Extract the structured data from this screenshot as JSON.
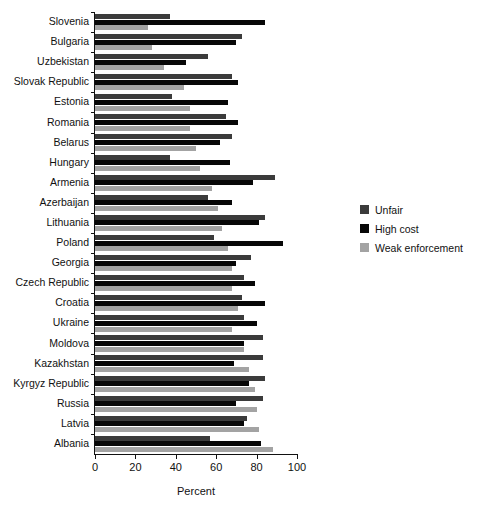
{
  "chart_data": {
    "type": "bar",
    "orientation": "horizontal",
    "title": "",
    "xlabel": "Percent",
    "ylabel": "",
    "xlim": [
      0,
      100
    ],
    "xticks": [
      0,
      20,
      40,
      60,
      80,
      100
    ],
    "xtick_labels": [
      "0",
      "20",
      "40",
      "60",
      "80",
      "100"
    ],
    "grid": false,
    "legend_position": "right",
    "categories": [
      "Slovenia",
      "Bulgaria",
      "Uzbekistan",
      "Slovak Republic",
      "Estonia",
      "Romania",
      "Belarus",
      "Hungary",
      "Armenia",
      "Azerbaijan",
      "Lithuania",
      "Poland",
      "Georgia",
      "Czech Republic",
      "Croatia",
      "Ukraine",
      "Moldova",
      "Kazakhstan",
      "Kyrgyz Republic",
      "Russia",
      "Latvia",
      "Albania"
    ],
    "series": [
      {
        "name": "Unfair",
        "color": "#3b3b3b",
        "values": [
          37,
          73,
          56,
          68,
          38,
          65,
          68,
          37,
          89,
          56,
          84,
          59,
          77,
          74,
          73,
          74,
          83,
          83,
          84,
          83,
          75,
          57
        ]
      },
      {
        "name": "High cost",
        "color": "#070707",
        "values": [
          84,
          70,
          45,
          71,
          66,
          71,
          62,
          67,
          78,
          68,
          81,
          93,
          70,
          79,
          84,
          80,
          74,
          69,
          76,
          70,
          74,
          82
        ]
      },
      {
        "name": "Weak enforcement",
        "color": "#a3a3a3",
        "values": [
          26,
          28,
          34,
          44,
          47,
          47,
          50,
          52,
          58,
          61,
          63,
          66,
          68,
          68,
          71,
          68,
          74,
          76,
          79,
          80,
          81,
          88
        ]
      }
    ]
  },
  "legend": {
    "items": [
      {
        "label": "Unfair",
        "swatch": "unfair"
      },
      {
        "label": "High cost",
        "swatch": "highcost"
      },
      {
        "label": "Weak enforcement",
        "swatch": "weak"
      }
    ]
  },
  "axis": {
    "x_title": "Percent"
  }
}
